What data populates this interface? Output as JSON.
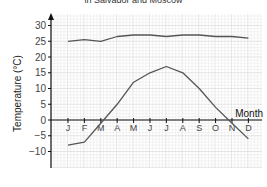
{
  "chart_data": {
    "type": "line",
    "title": "in Salvador and Moscow",
    "xlabel": "Month",
    "ylabel": "Temperature (°C)",
    "categories": [
      "J",
      "F",
      "M",
      "A",
      "M",
      "J",
      "J",
      "A",
      "S",
      "O",
      "N",
      "D"
    ],
    "yticks": [
      30,
      25,
      20,
      15,
      10,
      5,
      0,
      -5,
      -10
    ],
    "ylim": [
      -15,
      35
    ],
    "grid": true,
    "series": [
      {
        "name": "Salvador",
        "values": [
          25,
          25.5,
          25,
          26.5,
          27,
          27,
          26.5,
          27,
          27,
          26.5,
          26.5,
          26
        ]
      },
      {
        "name": "Moscow",
        "values": [
          -8,
          -7,
          -1,
          5,
          12,
          15,
          17,
          15,
          10,
          4,
          -1,
          -6
        ]
      }
    ],
    "colors": {
      "line": "#555555",
      "grid_minor": "#e6e6e6",
      "grid_major": "#cccccc",
      "axis": "#111111"
    }
  }
}
